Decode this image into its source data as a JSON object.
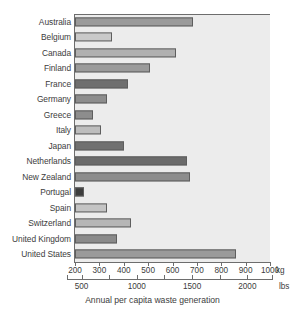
{
  "chart_data": {
    "type": "bar",
    "orientation": "horizontal",
    "title": "",
    "xlabel": "Annual per capita waste generation",
    "ylabel": "",
    "grid": false,
    "legend": null,
    "categories": [
      "Australia",
      "Belgium",
      "Canada",
      "Finland",
      "France",
      "Germany",
      "Greece",
      "Italy",
      "Japan",
      "Netherlands",
      "New Zealand",
      "Portugal",
      "Spain",
      "Switzerland",
      "United Kingdom",
      "United States"
    ],
    "values": [
      685,
      353,
      616,
      507,
      418,
      331,
      274,
      308,
      402,
      661,
      672,
      236,
      333,
      430,
      373,
      860
    ],
    "value_unit": "kg",
    "bar_colors": [
      "#9a9a9a",
      "#c9c9c9",
      "#b0b0b0",
      "#9a9a9a",
      "#6f6f6f",
      "#8d8d8d",
      "#8d8d8d",
      "#bdbdbd",
      "#707070",
      "#6b6b6b",
      "#8d8d8d",
      "#3d3d3d",
      "#c4c4c4",
      "#b6b6b6",
      "#8a8a8a",
      "#9a9a9a"
    ],
    "xlim": [
      200,
      1000
    ],
    "axes": [
      {
        "name": "kg",
        "unit_label": "kg",
        "min": 200,
        "max": 1000,
        "ticks": [
          200,
          300,
          400,
          500,
          600,
          700,
          800,
          900,
          1000
        ],
        "tick_labels": [
          "200",
          "300",
          "400",
          "500",
          "600",
          "700",
          "800",
          "900",
          "1000"
        ]
      },
      {
        "name": "lbs",
        "unit_label": "lbs",
        "min": 441,
        "max": 2205,
        "ticks": [
          500,
          750,
          1000,
          1250,
          1500,
          1750,
          2000,
          2250
        ],
        "labeled_ticks": [
          500,
          1000,
          1500,
          2000
        ],
        "tick_labels": [
          "500",
          "1000",
          "1500",
          "2000"
        ]
      }
    ],
    "colors": {
      "plot_background": "#ececec",
      "page_background": "#ffffff",
      "axis": "#6d6d6d",
      "text": "#3c3c3c",
      "bar_border": "#5e5e5e"
    }
  }
}
